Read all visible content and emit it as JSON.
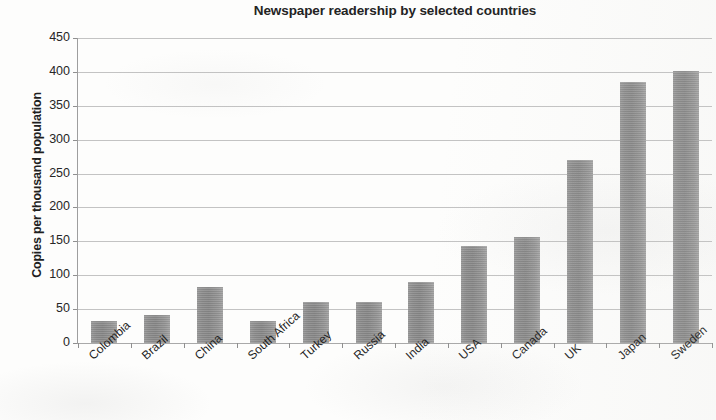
{
  "chart_data": {
    "type": "bar",
    "title": "Newspaper readership by selected countries",
    "xlabel": "",
    "ylabel": "Copies per thousand population",
    "ylim": [
      0,
      450
    ],
    "ytick_step": 50,
    "yticks": [
      "450",
      "400",
      "350",
      "300",
      "250",
      "200",
      "150",
      "100",
      "50",
      "0"
    ],
    "grid": true,
    "legend": false,
    "categories": [
      "Colombia",
      "Brazil",
      "China",
      "South Africa",
      "Turkey",
      "Russia",
      "India",
      "USA",
      "Canada",
      "UK",
      "Japan",
      "Sweden"
    ],
    "values": [
      32,
      42,
      83,
      32,
      60,
      60,
      90,
      143,
      157,
      270,
      385,
      402
    ],
    "series": [
      {
        "name": "Copies per thousand population",
        "values": [
          32,
          42,
          83,
          32,
          60,
          60,
          90,
          143,
          157,
          270,
          385,
          402
        ]
      }
    ],
    "bar_color": "#8f8f8f",
    "grid_color": "#b9b9b9",
    "background_color": "#fdfdfc",
    "text_color": "#232323"
  }
}
